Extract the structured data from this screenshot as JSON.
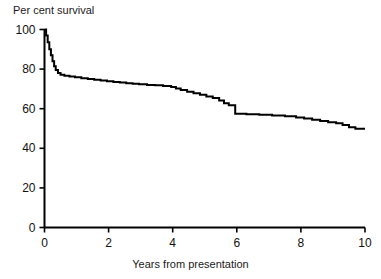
{
  "chart_data": {
    "type": "line",
    "title": "",
    "subtitle": "",
    "xlabel": "Years from presentation",
    "ylabel": "Per cent survival",
    "xlim": [
      0,
      10
    ],
    "ylim": [
      0,
      100
    ],
    "xticks": [
      0,
      2,
      4,
      6,
      8,
      10
    ],
    "yticks": [
      0,
      20,
      40,
      60,
      80,
      100
    ],
    "xtick_labels": [
      "0",
      "2",
      "4",
      "6",
      "8",
      "10"
    ],
    "ytick_labels": [
      "0",
      "20",
      "40",
      "60",
      "80",
      "100"
    ],
    "grid": false,
    "legend": null,
    "annotations": [],
    "line_color": "#000000",
    "line_width": 2,
    "background_color": "#ffffff",
    "axis_color": "#000000",
    "series": [
      {
        "name": "Per cent survival",
        "step": "post",
        "x": [
          0.0,
          0.05,
          0.1,
          0.15,
          0.2,
          0.25,
          0.3,
          0.35,
          0.42,
          0.5,
          0.62,
          0.78,
          0.95,
          1.15,
          1.35,
          1.55,
          1.75,
          1.95,
          2.15,
          2.35,
          2.55,
          2.75,
          2.95,
          3.2,
          3.45,
          3.7,
          3.95,
          4.1,
          4.25,
          4.45,
          4.65,
          4.85,
          5.05,
          5.25,
          5.45,
          5.6,
          5.75,
          5.95,
          6.3,
          6.7,
          7.1,
          7.5,
          7.85,
          8.1,
          8.35,
          8.6,
          8.85,
          9.1,
          9.3,
          9.5,
          9.7,
          10.0
        ],
        "y": [
          100.0,
          97.0,
          93.5,
          90.0,
          87.0,
          84.0,
          81.5,
          79.5,
          78.0,
          77.2,
          76.7,
          76.3,
          75.9,
          75.4,
          75.0,
          74.6,
          74.2,
          73.9,
          73.5,
          73.2,
          72.9,
          72.6,
          72.3,
          72.0,
          71.8,
          71.5,
          71.0,
          70.2,
          69.4,
          68.6,
          67.8,
          67.0,
          66.2,
          65.4,
          64.2,
          62.8,
          61.8,
          57.5,
          57.2,
          56.9,
          56.6,
          56.2,
          55.6,
          55.0,
          54.4,
          53.8,
          53.2,
          52.6,
          51.8,
          50.6,
          49.9,
          49.9
        ]
      }
    ]
  },
  "axis": {
    "y_title": "Per cent survival",
    "x_title": "Years from presentation"
  }
}
